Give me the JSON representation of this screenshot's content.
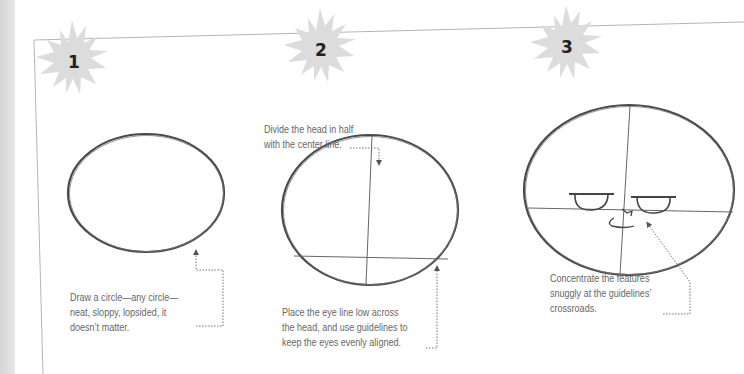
{
  "steps": [
    {
      "number": "1",
      "caption_lines": [
        "Draw a circle—any circle—",
        "neat, sloppy, lopsided, it",
        "doesn’t matter."
      ]
    },
    {
      "number": "2",
      "top_caption_lines": [
        "Divide the head in half",
        "with the center line."
      ],
      "caption_lines": [
        "Place the eye line low across",
        "the head, and use guidelines to",
        "keep the eyes evenly aligned."
      ]
    },
    {
      "number": "3",
      "caption_lines": [
        "Concentrate the features",
        "snuggly at the guidelines’",
        "crossroads."
      ]
    }
  ],
  "colors": {
    "badge": "#dcdcdc",
    "frame": "#b5b5b5",
    "stroke": "#444444",
    "text": "#666666",
    "leader": "#777777"
  }
}
